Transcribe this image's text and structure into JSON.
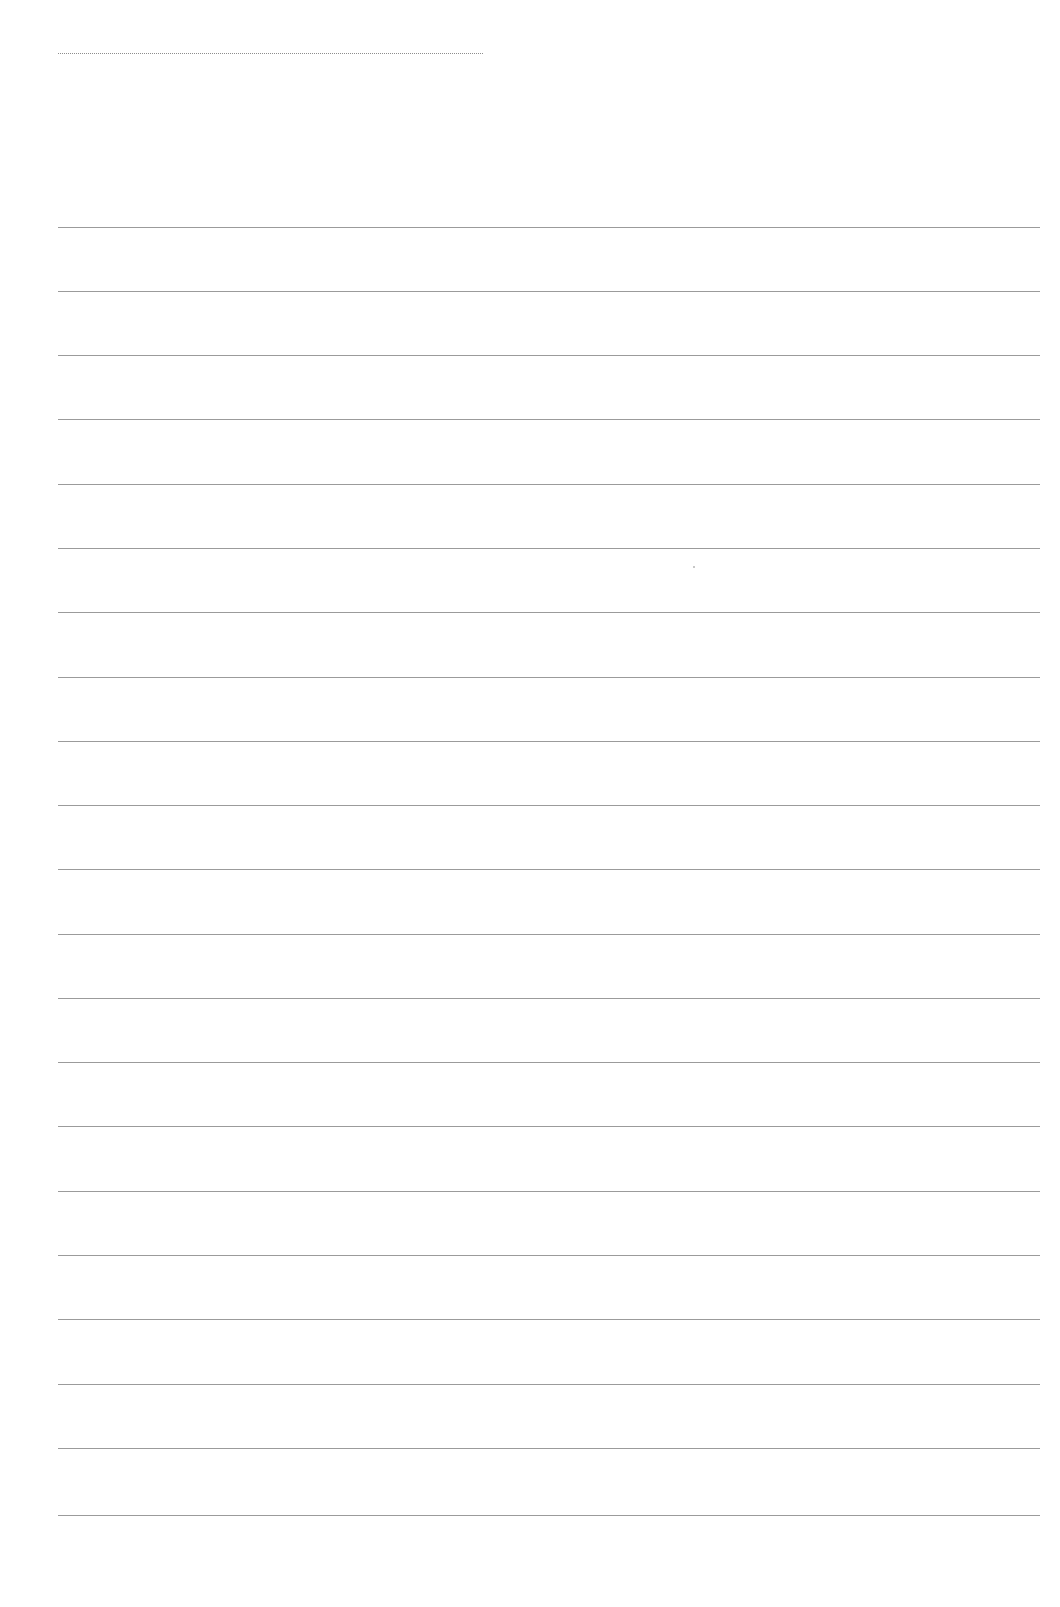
{
  "page": {
    "type": "blank-lined-paper",
    "background_color": "#ffffff",
    "line_color": "#8a8a8a"
  },
  "header_rule": {
    "x_start": 58,
    "x_end": 483,
    "y": 53
  },
  "ruled_lines": {
    "count": 21,
    "x_start": 58,
    "x_end": 1040,
    "y_positions": [
      227,
      291,
      355,
      419,
      484,
      548,
      612,
      677,
      741,
      805,
      869,
      934,
      998,
      1062,
      1126,
      1191,
      1255,
      1319,
      1384,
      1448,
      1515
    ]
  },
  "specks": [
    {
      "x": 693,
      "y": 566
    }
  ]
}
